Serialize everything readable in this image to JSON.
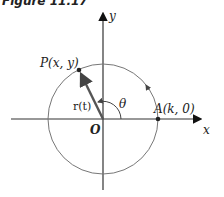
{
  "figure": {
    "caption": "Figure 11.17",
    "origin_label": "O",
    "x_axis_label": "x",
    "y_axis_label": "y",
    "point_P_label": "P(x, y)",
    "point_A_label": "A(k, 0)",
    "vector_label": "r(t)",
    "angle_label": "θ",
    "colors": {
      "axes": "#333333",
      "circle": "#777777",
      "vector": "#555555",
      "points": "#222222"
    }
  }
}
